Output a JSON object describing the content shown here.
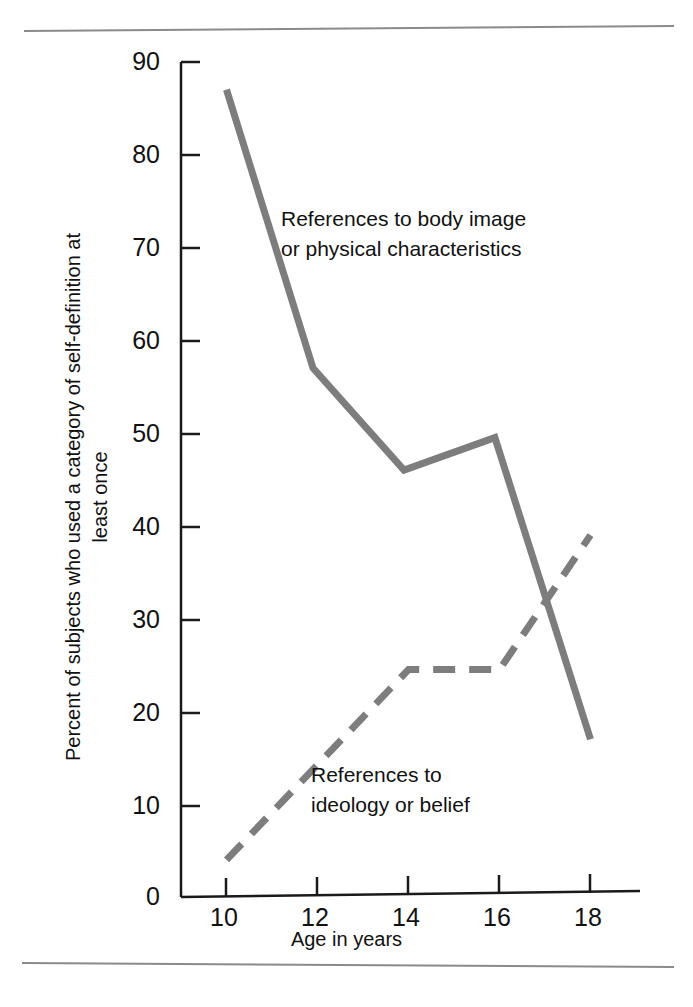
{
  "figure": {
    "line_color": "#7d7d7d",
    "axis_color": "#1a1a1a",
    "rule_color": "#8a8a8a"
  },
  "axes": {
    "y_title": "Percent of subjects who used a category of\nself-definition at least once",
    "x_title": "Age in years",
    "y_ticks": [
      "90",
      "80",
      "70",
      "60",
      "50",
      "40",
      "30",
      "20",
      "10",
      "0"
    ],
    "x_ticks": [
      "10",
      "12",
      "14",
      "16",
      "18"
    ]
  },
  "annotations": {
    "body_image": "References to body image\nor physical characteristics",
    "ideology": "References to\nideology or belief"
  },
  "chart_data": {
    "type": "line",
    "title": "",
    "xlabel": "Age in years",
    "ylabel": "Percent of subjects who used a category of self-definition at least once",
    "xlim": [
      9.0,
      18.8
    ],
    "ylim": [
      0,
      90
    ],
    "xticks": [
      10,
      12,
      14,
      16,
      18
    ],
    "yticks": [
      0,
      10,
      20,
      30,
      40,
      50,
      60,
      70,
      80,
      90
    ],
    "grid": false,
    "legend": "inline-annotations",
    "series": [
      {
        "name": "References to body image or physical characteristics",
        "style": "solid",
        "color": "#7d7d7d",
        "x": [
          10.0,
          11.9,
          13.9,
          15.9,
          18.0
        ],
        "y": [
          87,
          57,
          46,
          49.5,
          17
        ]
      },
      {
        "name": "References to ideology or belief",
        "style": "dashed",
        "color": "#7d7d7d",
        "x": [
          10.0,
          14.0,
          16.0,
          18.0
        ],
        "y": [
          4,
          24.5,
          24.5,
          39
        ]
      }
    ]
  }
}
